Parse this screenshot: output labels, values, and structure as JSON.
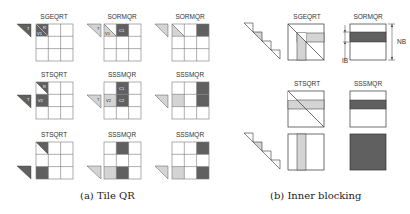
{
  "colors": {
    "dark": "#606060",
    "light": "#d4d4d4",
    "grid": "#777777",
    "line": "#333333"
  },
  "tile_qr": {
    "caption": "(a) Tile QR",
    "panels": [
      {
        "title": "SGEQRT",
        "side": "T",
        "cells": {
          "r0c0": "R / V1"
        }
      },
      {
        "title": "SORMQR",
        "side": "T",
        "cells": {
          "r0c0": "V1",
          "r0c1": "C1"
        }
      },
      {
        "title": "SORMQR"
      },
      {
        "title": "STSQRT",
        "side": "T",
        "cells": {
          "r0c0": "R",
          "r1c0": "V2"
        }
      },
      {
        "title": "SSSMQR",
        "side": "T",
        "cells": {
          "r0c1": "C1",
          "r1c0": "V2",
          "r1c1": "C2"
        }
      },
      {
        "title": "SSSMQR"
      },
      {
        "title": "STSQRT"
      },
      {
        "title": "SSSMQR"
      },
      {
        "title": "SSSMQR"
      }
    ]
  },
  "inner_blocking": {
    "caption": "(b) Inner blocking",
    "panels": [
      {
        "title": "SGEQRT"
      },
      {
        "title": "SORMQR",
        "ib_label": "IB",
        "nb_label": "NB"
      },
      {
        "title": "STSQRT"
      },
      {
        "title": "SSSMQR"
      }
    ]
  }
}
